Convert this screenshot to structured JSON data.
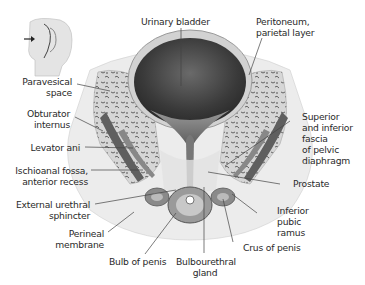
{
  "diagram": {
    "orientation_icon": "head-orientation-icon",
    "labels": {
      "urinary_bladder": "Urinary bladder",
      "peritoneum_1": "Peritoneum,",
      "peritoneum_2": "parietal layer",
      "paravesical_1": "Paravesical",
      "paravesical_2": "space",
      "obturator_1": "Obturator",
      "obturator_2": "internus",
      "levator": "Levator ani",
      "ischioanal_1": "Ischioanal fossa,",
      "ischioanal_2": "anterior recess",
      "ext_urethral_1": "External urethral",
      "ext_urethral_2": "sphincter",
      "perineal_1": "Perineal",
      "perineal_2": "membrane",
      "bulb": "Bulb of penis",
      "bulbourethral_1": "Bulbourethral",
      "bulbourethral_2": "gland",
      "crus": "Crus of penis",
      "inf_pubic_1": "Inferior",
      "inf_pubic_2": "pubic",
      "inf_pubic_3": "ramus",
      "prostate": "Prostate",
      "sup_inf_1": "Superior",
      "sup_inf_2": "and inferior",
      "sup_inf_3": "fascia",
      "sup_inf_4": "of pelvic",
      "sup_inf_5": "diaphragm"
    },
    "colors": {
      "bladder_lumen": "#3a3a3a",
      "bone": "#d8d8d8",
      "muscle": "#6a6a6a",
      "leader_line": "#444444"
    }
  }
}
